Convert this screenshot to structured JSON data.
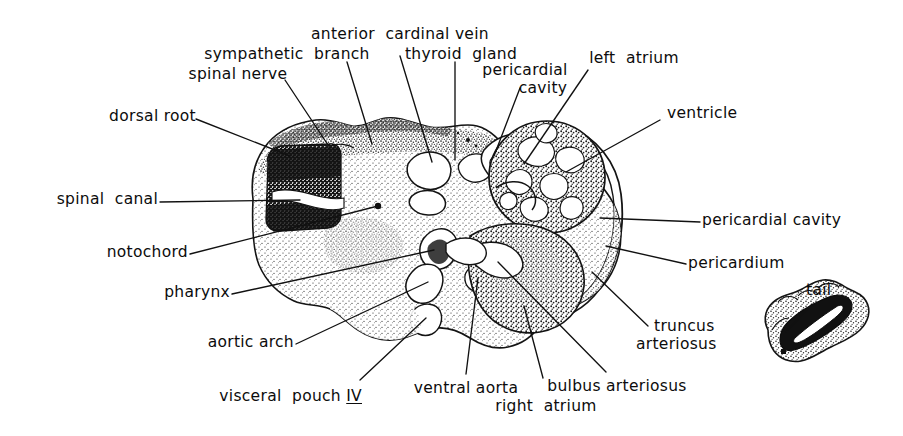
{
  "figure": {
    "background_color": "#ffffff",
    "ink_color": "#111111",
    "width": 903,
    "height": 436
  },
  "labels": {
    "anterior_cardinal_vein": "anterior  cardinal vein",
    "thyroid_gland": "thyroid  gland",
    "sympathetic_branch": "sympathetic  branch",
    "spinal_nerve": "spinal nerve",
    "pericardial_cavity_top": "pericardial",
    "pericardial_cavity_top2": "cavity",
    "left_atrium": "left  atrium",
    "ventricle": "ventricle",
    "dorsal_root": "dorsal root",
    "spinal_canal": "spinal  canal",
    "notochord": "notochord",
    "pharynx": "pharynx",
    "aortic_arch": "aortic arch",
    "visceral_pouch": "visceral  pouch ",
    "visceral_pouch_numeral": "IV",
    "ventral_aorta": "ventral aorta",
    "right_atrium": "right  atrium",
    "bulbus_arteriosus": "bulbus arteriosus",
    "truncus": "truncus",
    "arteriosus": "arteriosus",
    "pericardial_cavity_right": "pericardial cavity",
    "pericardium": "pericardium",
    "tail": "tail"
  },
  "structures": {
    "main_section": "embryo-cross-section",
    "neural_tube": "neural-tube",
    "spinal_canal_lumen": "spinal-canal-lumen",
    "notochord_body": "notochord",
    "pharynx_cavity": "pharynx-cavity",
    "heart_ventricle": "ventricle-trabeculae",
    "pericardial_space": "pericardial-cavity-space",
    "pericardium_wall": "pericardium-wall",
    "tail_section": "tail-cross-section"
  }
}
